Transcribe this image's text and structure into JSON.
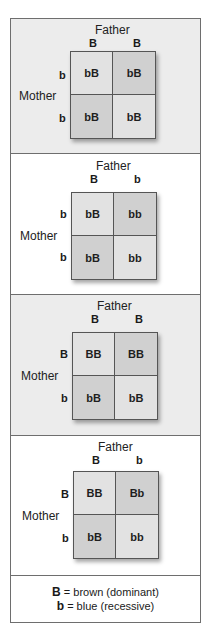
{
  "diagram": {
    "labels": {
      "father": "Father",
      "mother": "Mother"
    },
    "colors": {
      "frame": "#6e6e6e",
      "gray_panel": "#ececec",
      "light_cell": "#e2e2e2",
      "dark_cell": "#d0d0d0"
    },
    "panels": [
      {
        "background": "gray",
        "father_alleles": [
          "B",
          "B"
        ],
        "mother_alleles": [
          "b",
          "b"
        ],
        "cells": [
          "bB",
          "bB",
          "bB",
          "bB"
        ]
      },
      {
        "background": "white",
        "father_alleles": [
          "B",
          "b"
        ],
        "mother_alleles": [
          "b",
          "b"
        ],
        "cells": [
          "bB",
          "bb",
          "bB",
          "bb"
        ]
      },
      {
        "background": "gray",
        "father_alleles": [
          "B",
          "B"
        ],
        "mother_alleles": [
          "B",
          "b"
        ],
        "cells": [
          "BB",
          "BB",
          "bB",
          "bB"
        ]
      },
      {
        "background": "white",
        "father_alleles": [
          "B",
          "b"
        ],
        "mother_alleles": [
          "B",
          "b"
        ],
        "cells": [
          "BB",
          "Bb",
          "bB",
          "bb"
        ]
      }
    ],
    "legend": [
      {
        "symbol": "B",
        "text": " = brown (dominant)"
      },
      {
        "symbol": "b",
        "text": " = blue (recessive)"
      }
    ]
  }
}
